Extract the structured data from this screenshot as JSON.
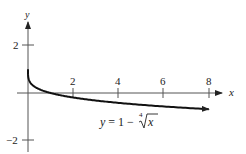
{
  "chart_data": {
    "type": "line",
    "title": "",
    "function": "y = 1 - x^(1/4)",
    "xlabel": "x",
    "ylabel": "y",
    "x_ticks": [
      2,
      4,
      6,
      8
    ],
    "y_ticks": [
      2,
      -2
    ],
    "x_tick_labels": [
      "2",
      "4",
      "6",
      "8"
    ],
    "y_tick_labels": [
      "2",
      "−2"
    ],
    "xlim": [
      -0.4,
      8.5
    ],
    "ylim": [
      -2.5,
      2.9
    ],
    "grid": false,
    "legend": null,
    "annotation": {
      "prefix": "y = 1 − ",
      "root_index": "4",
      "radicand": "x"
    },
    "series": [
      {
        "name": "y = 1 - 4th root of x",
        "x": [
          0,
          0.01,
          0.05,
          0.1,
          0.25,
          0.5,
          1,
          1.5,
          2,
          3,
          4,
          5,
          6,
          7,
          8
        ],
        "y": [
          1,
          0.684,
          0.527,
          0.438,
          0.293,
          0.159,
          0,
          -0.107,
          -0.189,
          -0.316,
          -0.414,
          -0.495,
          -0.565,
          -0.627,
          -0.682
        ]
      }
    ]
  }
}
